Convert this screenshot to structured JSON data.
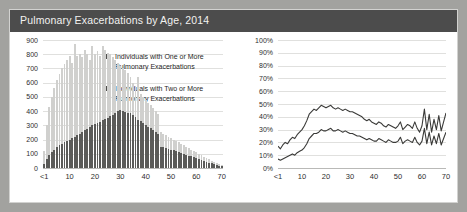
{
  "title": "Pulmonary Exacerbations by Age, 2014",
  "colors": {
    "frame": "#a2a29f",
    "titlebar": "#4c4c4c",
    "title_text": "#f2f2f0",
    "panel": "#ffffff",
    "series_one": "#d0d0ce",
    "series_two": "#5a5a58",
    "legend_swatch": "#4f4f4d",
    "gridline": "#e0e0de",
    "axis": "#b9b9b7",
    "line": "#3a3a38"
  },
  "legend": {
    "position": "top-right-of-left-panel",
    "items": [
      {
        "swatch": "#4f4f4d",
        "label": "Individuals with One or More Pulmonary Exacerbations"
      },
      {
        "swatch": "#4f4f4d",
        "label": "Individuals with Two or More Pulmonary Exacerbations"
      }
    ]
  },
  "chart_data": [
    {
      "type": "bar",
      "id": "counts-by-age",
      "title": "Pulmonary Exacerbations by Age, 2014",
      "xlabel": "",
      "ylabel": "",
      "ylim": [
        0,
        900
      ],
      "ytick_labels": [
        "0",
        "100",
        "200",
        "300",
        "400",
        "500",
        "600",
        "700",
        "800",
        "900"
      ],
      "ytick_values": [
        0,
        100,
        200,
        300,
        400,
        500,
        600,
        700,
        800,
        900
      ],
      "xtick_labels": [
        "<1",
        "10",
        "20",
        "30",
        "40",
        "50",
        "60",
        "70"
      ],
      "xtick_values": [
        0,
        10,
        20,
        30,
        40,
        50,
        60,
        70
      ],
      "grid": true,
      "barmode": "overlay",
      "x": [
        0,
        1,
        2,
        3,
        4,
        5,
        6,
        7,
        8,
        9,
        10,
        11,
        12,
        13,
        14,
        15,
        16,
        17,
        18,
        19,
        20,
        21,
        22,
        23,
        24,
        25,
        26,
        27,
        28,
        29,
        30,
        31,
        32,
        33,
        34,
        35,
        36,
        37,
        38,
        39,
        40,
        41,
        42,
        43,
        44,
        45,
        46,
        47,
        48,
        49,
        50,
        51,
        52,
        53,
        54,
        55,
        56,
        57,
        58,
        59,
        60,
        61,
        62,
        63,
        64,
        65,
        66,
        67,
        68,
        69,
        70
      ],
      "series": [
        {
          "name": "Individuals with One or More Pulmonary Exacerbations",
          "color": "#d0d0ce",
          "values": [
            120,
            300,
            430,
            500,
            560,
            620,
            660,
            700,
            730,
            760,
            790,
            740,
            870,
            790,
            800,
            780,
            830,
            800,
            760,
            860,
            800,
            820,
            790,
            860,
            830,
            810,
            800,
            780,
            760,
            740,
            720,
            700,
            690,
            670,
            640,
            600,
            580,
            640,
            520,
            500,
            480,
            460,
            440,
            420,
            400,
            380,
            250,
            240,
            230,
            220,
            210,
            200,
            190,
            180,
            170,
            160,
            150,
            140,
            130,
            120,
            110,
            100,
            90,
            80,
            70,
            60,
            50,
            45,
            35,
            25,
            20
          ]
        },
        {
          "name": "Individuals with Two or More Pulmonary Exacerbations",
          "color": "#5a5a58",
          "values": [
            30,
            60,
            90,
            110,
            130,
            150,
            160,
            170,
            180,
            190,
            200,
            210,
            220,
            230,
            240,
            250,
            265,
            275,
            285,
            300,
            310,
            320,
            325,
            335,
            345,
            355,
            365,
            375,
            390,
            400,
            405,
            400,
            395,
            390,
            385,
            370,
            360,
            340,
            330,
            320,
            300,
            290,
            280,
            270,
            255,
            240,
            150,
            145,
            140,
            135,
            130,
            125,
            118,
            112,
            105,
            100,
            95,
            88,
            82,
            76,
            70,
            64,
            58,
            50,
            44,
            38,
            32,
            27,
            21,
            16,
            12
          ]
        }
      ]
    },
    {
      "type": "line",
      "id": "percent-by-age",
      "title": "",
      "xlabel": "",
      "ylabel": "",
      "ylim": [
        0,
        100
      ],
      "ytick_labels": [
        "0%",
        "10%",
        "20%",
        "30%",
        "40%",
        "50%",
        "60%",
        "70%",
        "80%",
        "90%",
        "100%"
      ],
      "ytick_values": [
        0,
        10,
        20,
        30,
        40,
        50,
        60,
        70,
        80,
        90,
        100
      ],
      "xtick_labels": [
        "<1",
        "10",
        "20",
        "30",
        "40",
        "50",
        "60",
        "70"
      ],
      "xtick_values": [
        0,
        10,
        20,
        30,
        40,
        50,
        60,
        70
      ],
      "grid": true,
      "x": [
        0,
        1,
        2,
        3,
        4,
        5,
        6,
        7,
        8,
        9,
        10,
        11,
        12,
        13,
        14,
        15,
        16,
        17,
        18,
        19,
        20,
        21,
        22,
        23,
        24,
        25,
        26,
        27,
        28,
        29,
        30,
        31,
        32,
        33,
        34,
        35,
        36,
        37,
        38,
        39,
        40,
        41,
        42,
        43,
        44,
        45,
        46,
        47,
        48,
        49,
        50,
        51,
        52,
        53,
        54,
        55,
        56,
        57,
        58,
        59,
        60,
        61,
        62,
        63,
        64,
        65,
        66,
        67,
        68,
        69,
        70
      ],
      "series": [
        {
          "name": "Percent with One or More Pulmonary Exacerbations",
          "color": "#3a3a38",
          "values": [
            17,
            15,
            18,
            20,
            19,
            22,
            24,
            23,
            26,
            28,
            30,
            33,
            37,
            42,
            44,
            46,
            45,
            47,
            49,
            48,
            47,
            48,
            49,
            47,
            46,
            47,
            46,
            45,
            46,
            45,
            44,
            44,
            43,
            42,
            41,
            40,
            38,
            37,
            38,
            36,
            35,
            34,
            36,
            35,
            33,
            32,
            34,
            33,
            32,
            31,
            33,
            36,
            30,
            32,
            34,
            33,
            31,
            36,
            31,
            28,
            33,
            46,
            30,
            42,
            28,
            38,
            30,
            41,
            29,
            36,
            43
          ]
        },
        {
          "name": "Percent with Two or More Pulmonary Exacerbations",
          "color": "#3a3a38",
          "values": [
            7,
            6,
            7,
            8,
            9,
            10,
            11,
            10,
            12,
            13,
            14,
            16,
            19,
            23,
            25,
            27,
            27,
            28,
            30,
            29,
            29,
            30,
            31,
            29,
            29,
            30,
            29,
            28,
            29,
            28,
            27,
            27,
            26,
            25,
            25,
            24,
            23,
            22,
            23,
            22,
            21,
            21,
            23,
            22,
            21,
            20,
            22,
            21,
            20,
            20,
            21,
            24,
            19,
            21,
            22,
            21,
            20,
            24,
            20,
            18,
            21,
            31,
            19,
            28,
            18,
            25,
            19,
            27,
            18,
            23,
            28
          ]
        }
      ]
    }
  ]
}
